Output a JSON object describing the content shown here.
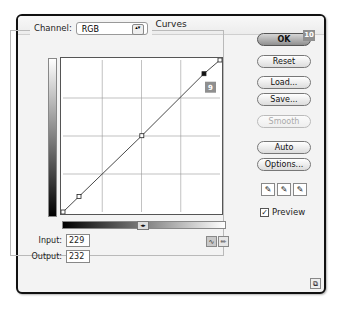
{
  "window": {
    "title": "Curves"
  },
  "channel": {
    "label": "Channel:",
    "value": "RGB"
  },
  "curve": {
    "points": [
      [
        0,
        0
      ],
      [
        26,
        26
      ],
      [
        128,
        128
      ],
      [
        229,
        232
      ],
      [
        255,
        255
      ]
    ],
    "selected_point": [
      229,
      232
    ],
    "grid_divisions": 4
  },
  "io": {
    "input_label": "Input:",
    "input_value": "229",
    "output_label": "Output:",
    "output_value": "232"
  },
  "buttons": {
    "ok": "OK",
    "reset": "Reset",
    "load": "Load...",
    "save": "Save...",
    "smooth": "Smooth",
    "auto": "Auto",
    "options": "Options..."
  },
  "annotations": {
    "ok_badge": "10",
    "point_badge": "9"
  },
  "preview": {
    "label": "Preview",
    "checked": true
  },
  "icons": {
    "eyedropper": "✎",
    "curve_tool": "∿",
    "pencil_tool": "✏",
    "toggle": "◂▸",
    "resize": "⧉",
    "select_arrows": "▴▾",
    "check": "✓"
  }
}
